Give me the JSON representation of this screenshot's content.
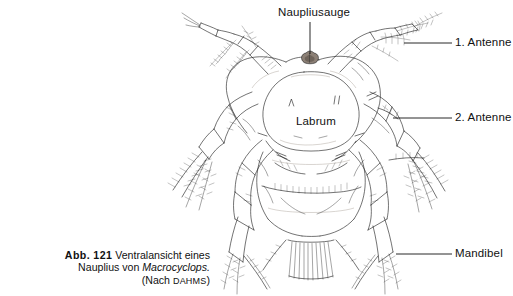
{
  "figure": {
    "id_label": "Abb. 121",
    "caption_line1": "Ventralansicht eines",
    "caption_line2_prefix": "Nauplius von ",
    "caption_line2_species": "Macrocyclops.",
    "caption_line3_prefix": "(Nach ",
    "caption_line3_source": "Dahms",
    "caption_line3_suffix": ")"
  },
  "labels": {
    "naupliar_eye": "Naupliusauge",
    "first_antenna": "1. Antenne",
    "second_antenna": "2. Antenne",
    "mandible": "Mandibel",
    "labrum": "Labrum"
  },
  "colors": {
    "background": "#ffffff",
    "ink": "#1d1d1d",
    "text": "#111111",
    "eye_fill": "#8c8076",
    "leader": "#111111"
  },
  "illustration": {
    "subject": "copepod nauplius larva, ventral view",
    "technique": "ink line drawing with plumose setae",
    "parts": [
      "naupliar eye",
      "labrum",
      "first antenna (left and right)",
      "second antenna (left and right)",
      "mandible (left and right)",
      "caudal setae"
    ]
  }
}
